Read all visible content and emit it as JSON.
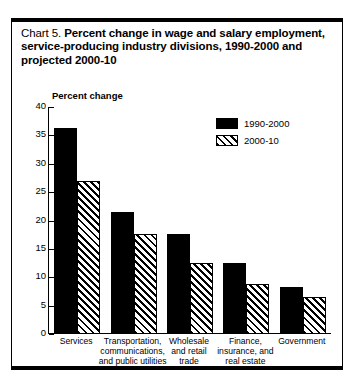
{
  "chart_data": {
    "type": "bar",
    "title": "Chart 5.  Percent change in wage and salary employment, service-producing industry divisions, 1990-2000 and projected 2000-10",
    "title_prefix": "Chart 5.",
    "title_main": "Percent change in wage and salary employment, service-producing industry divisions, 1990-2000 and projected 2000-10",
    "ylabel": "Percent change",
    "xlabel": "",
    "ylim": [
      0,
      40
    ],
    "yticks": [
      0,
      5,
      10,
      15,
      20,
      25,
      30,
      35,
      40
    ],
    "ytick_labels": [
      "0",
      "5",
      "10",
      "15",
      "20",
      "25",
      "30",
      "35",
      "40"
    ],
    "grid": false,
    "legend_position": "top-right",
    "categories": [
      "Services",
      "Transportation, communications, and public utilities",
      "Wholesale and retail trade",
      "Finance, insurance, and real estate",
      "Government"
    ],
    "category_lines": [
      [
        "Services"
      ],
      [
        "Transportation,",
        "communications,",
        "and public utilities"
      ],
      [
        "Wholesale",
        "and retail",
        "trade"
      ],
      [
        "Finance,",
        "insurance, and",
        "real estate"
      ],
      [
        "Government"
      ]
    ],
    "series": [
      {
        "name": "1990-2000",
        "pattern": "solid",
        "color": "#000000",
        "values": [
          36.3,
          21.5,
          17.6,
          12.5,
          8.2
        ]
      },
      {
        "name": "2000-10",
        "pattern": "diagonal-hatch",
        "color": "#000000",
        "values": [
          27.0,
          17.7,
          12.6,
          8.8,
          6.5
        ]
      }
    ]
  }
}
